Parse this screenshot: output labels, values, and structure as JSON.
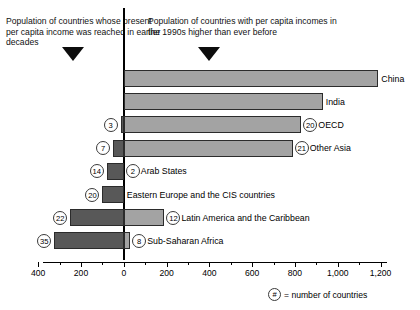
{
  "header": {
    "caption_left": "Population of countries whose present per capita income was reached in earlier decades",
    "caption_right": "Population of countries with per capita incomes in the 1990s higher than ever before",
    "arrow_left_name": "down-arrow-icon",
    "arrow_right_name": "down-arrow-icon"
  },
  "footnote": {
    "badge": "#",
    "text": "= number of countries"
  },
  "colors": {
    "left_bar": "#585858",
    "right_bar": "#a3a3a3",
    "axis": "#000000",
    "background": "#ffffff"
  },
  "chart_data": {
    "type": "bar",
    "title": "",
    "subtitle": "",
    "orientation": "horizontal",
    "style": "diverging back-to-back bar",
    "xlabel": "",
    "ylabel": "",
    "xlim": [
      -500,
      1200
    ],
    "grid": false,
    "legend_position": "bottom-right",
    "axis_ticks_major": [
      -400,
      -200,
      0,
      200,
      400,
      600,
      800,
      1000,
      1200
    ],
    "axis_tick_labels": [
      "400",
      "200",
      "0",
      "200",
      "400",
      "600",
      "800",
      "1,000",
      "1,200"
    ],
    "axis_ticks_minor": [
      -500,
      -300,
      -100,
      100,
      300,
      500,
      700,
      900,
      1100
    ],
    "categories": [
      "China",
      "India",
      "OECD",
      "Other Asia",
      "Arab States",
      "Eastern Europe and the CIS countries",
      "Latin America and the Caribbean",
      "Sub-Saharan Africa"
    ],
    "series": [
      {
        "name": "Population of countries whose present per capita income was reached in earlier decades",
        "side": "left",
        "color": "#585858",
        "values": [
          0,
          0,
          15,
          50,
          80,
          100,
          250,
          325
        ]
      },
      {
        "name": "Population of countries with per capita incomes in the 1990s higher than ever before",
        "side": "right",
        "color": "#a3a3a3",
        "values": [
          1190,
          930,
          830,
          790,
          0,
          0,
          190,
          30
        ]
      }
    ],
    "country_counts_left": [
      "",
      "",
      "3",
      "7",
      "14",
      "20",
      "22",
      "35"
    ],
    "country_counts_right": [
      "",
      "",
      "20",
      "21",
      "2",
      "",
      "12",
      "8"
    ],
    "rows": [
      {
        "label": "China",
        "left": 0,
        "right": 1190,
        "count_left": "",
        "count_right": ""
      },
      {
        "label": "India",
        "left": 0,
        "right": 930,
        "count_left": "",
        "count_right": ""
      },
      {
        "label": "OECD",
        "left": 15,
        "right": 830,
        "count_left": "3",
        "count_right": "20"
      },
      {
        "label": "Other Asia",
        "left": 50,
        "right": 790,
        "count_left": "7",
        "count_right": "21"
      },
      {
        "label": "Arab States",
        "left": 80,
        "right": 0,
        "count_left": "14",
        "count_right": "2"
      },
      {
        "label": "Eastern Europe and the CIS countries",
        "left": 100,
        "right": 0,
        "count_left": "20",
        "count_right": ""
      },
      {
        "label": "Latin America and the Caribbean",
        "left": 250,
        "right": 190,
        "count_left": "22",
        "count_right": "12"
      },
      {
        "label": "Sub-Saharan Africa",
        "left": 325,
        "right": 30,
        "count_left": "35",
        "count_right": "8"
      }
    ]
  }
}
